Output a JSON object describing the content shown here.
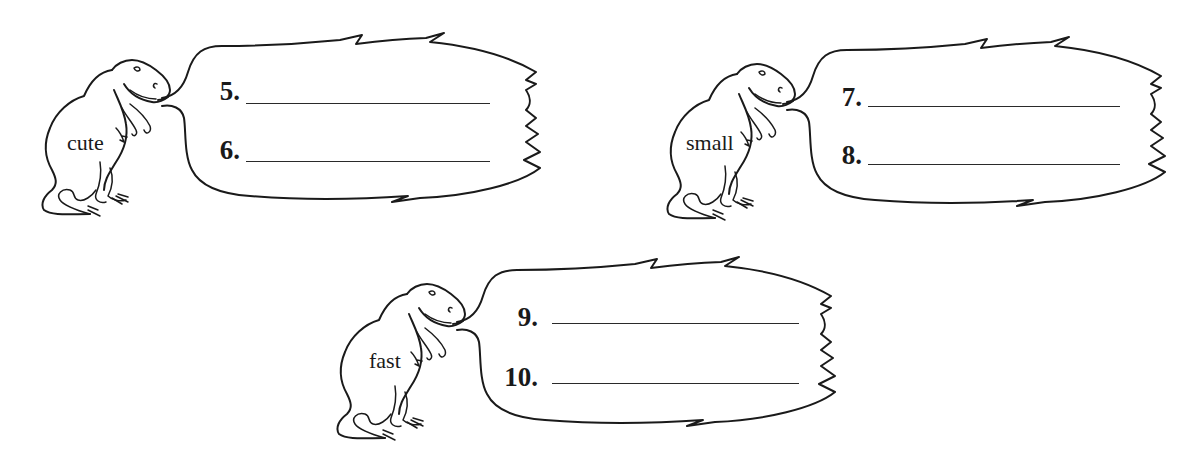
{
  "worksheet": {
    "groups": [
      {
        "dino_word": "cute",
        "items": [
          {
            "number": "5.",
            "answer": ""
          },
          {
            "number": "6.",
            "answer": ""
          }
        ]
      },
      {
        "dino_word": "small",
        "items": [
          {
            "number": "7.",
            "answer": ""
          },
          {
            "number": "8.",
            "answer": ""
          }
        ]
      },
      {
        "dino_word": "fast",
        "items": [
          {
            "number": "9.",
            "answer": ""
          },
          {
            "number": "10.",
            "answer": ""
          }
        ]
      }
    ],
    "icons": {
      "dinosaur": "t-rex-outline-icon",
      "speech_bubble": "jagged-speech-bubble"
    },
    "colors": {
      "ink": "#1a1a1a",
      "background": "#ffffff"
    }
  }
}
